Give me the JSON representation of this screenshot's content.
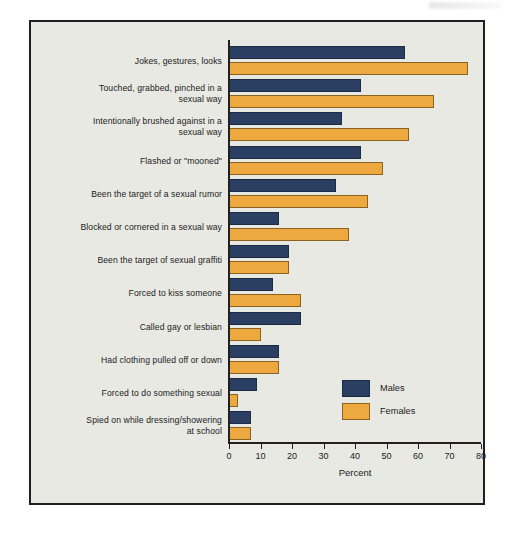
{
  "chart_data": {
    "type": "bar",
    "orientation": "horizontal",
    "title": "",
    "xlabel": "Percent",
    "ylabel": "",
    "xlim": [
      0,
      80
    ],
    "xticks": [
      0,
      10,
      20,
      30,
      40,
      50,
      60,
      70,
      80
    ],
    "xtick_labels": [
      "0",
      "10",
      "20",
      "30",
      "40",
      "50",
      "60",
      "70",
      "80"
    ],
    "grid": false,
    "legend_position": "inside-right-lower",
    "categories": [
      "Jokes, gestures, looks",
      "Touched, grabbed, pinched in a sexual way",
      "Intentionally brushed against in a sexual way",
      "Flashed or \"mooned\"",
      "Been the target of a sexual rumor",
      "Blocked or cornered in a sexual way",
      "Been the target of sexual graffiti",
      "Forced to kiss someone",
      "Called gay or lesbian",
      "Had clothing pulled off or down",
      "Forced to do something sexual",
      "Spied on while dressing/showering at school"
    ],
    "category_lines": [
      [
        "Jokes, gestures, looks"
      ],
      [
        "Touched, grabbed, pinched in a",
        "sexual way"
      ],
      [
        "Intentionally brushed against in a",
        "sexual way"
      ],
      [
        "Flashed or \"mooned\""
      ],
      [
        "Been the target of a sexual rumor"
      ],
      [
        "Blocked or cornered in a sexual way"
      ],
      [
        "Been the target of sexual graffiti"
      ],
      [
        "Forced to kiss someone"
      ],
      [
        "Called gay or lesbian"
      ],
      [
        "Had clothing pulled off or down"
      ],
      [
        "Forced to do something sexual"
      ],
      [
        "Spied on while dressing/showering",
        "at school"
      ]
    ],
    "series": [
      {
        "name": "Males",
        "color": "#2b3f63",
        "values": [
          56,
          42,
          36,
          42,
          34,
          16,
          19,
          14,
          23,
          16,
          9,
          7
        ]
      },
      {
        "name": "Females",
        "color": "#eda93f",
        "values": [
          76,
          65,
          57,
          49,
          44,
          38,
          19,
          23,
          10,
          16,
          3,
          7
        ]
      }
    ]
  },
  "legend": {
    "items": [
      {
        "label": "Males",
        "color": "#2b3f63"
      },
      {
        "label": "Females",
        "color": "#eda93f"
      }
    ]
  },
  "axis": {
    "x_title": "Percent"
  },
  "colors": {
    "male_bar": "#2b3f63",
    "female_bar": "#eda93f",
    "plot_background": "#e9e9e4",
    "frame_border": "#231f20",
    "text": "#1a1a1a"
  }
}
